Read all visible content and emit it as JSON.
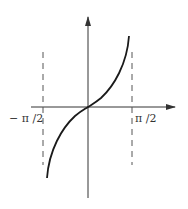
{
  "figure": {
    "type": "function-graph",
    "function": "y = tan x",
    "x_labels": {
      "neg_half_pi": "− π /2",
      "pos_half_pi": "π /2"
    },
    "asymptotes": [
      "x = -π/2",
      "x = π/2"
    ],
    "colors": {
      "curve": "#1a1a1a",
      "axes": "#333333",
      "asymptote": "#555555",
      "background": "#ffffff"
    }
  }
}
